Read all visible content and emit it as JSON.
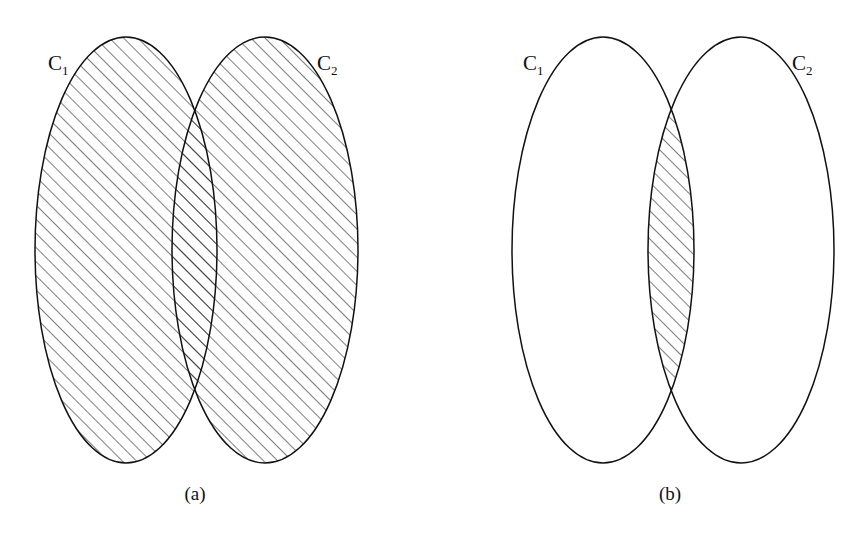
{
  "figure": {
    "panels": [
      {
        "id": "a",
        "caption": "(a)",
        "description": "Union of C1 and C2 shaded",
        "sets": [
          {
            "name": "C",
            "subscript": "1"
          },
          {
            "name": "C",
            "subscript": "2"
          }
        ],
        "shaded_region": "union"
      },
      {
        "id": "b",
        "caption": "(b)",
        "description": "Intersection of C1 and C2 shaded",
        "sets": [
          {
            "name": "C",
            "subscript": "1"
          },
          {
            "name": "C",
            "subscript": "2"
          }
        ],
        "shaded_region": "intersection"
      }
    ],
    "colors": {
      "stroke": "#111111",
      "background": "#ffffff"
    }
  }
}
